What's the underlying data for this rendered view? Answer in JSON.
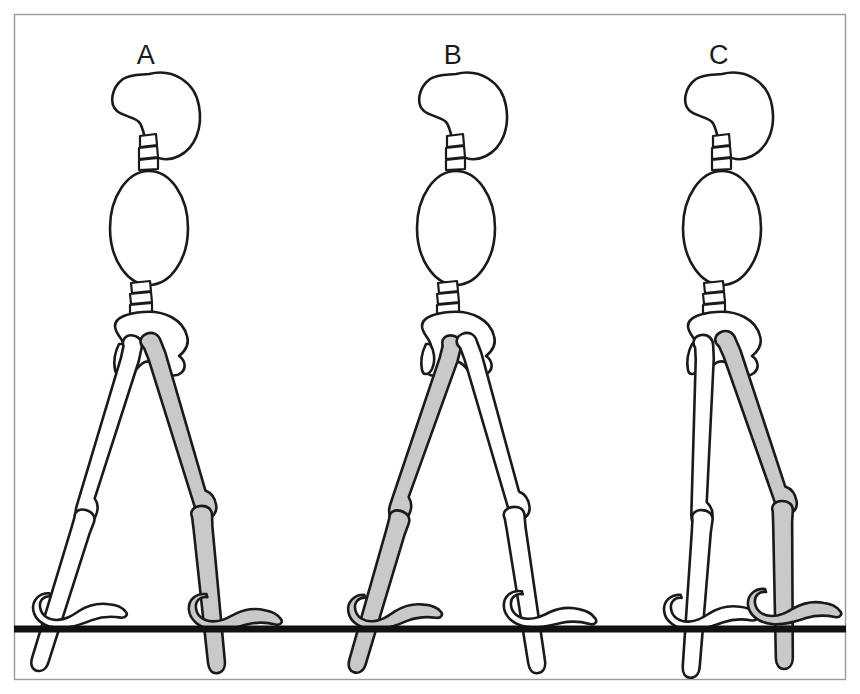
{
  "figure": {
    "panel": {
      "background_color": "#ffffff",
      "border_color": "#9a9a9a",
      "x": 14,
      "y": 14,
      "width": 832,
      "height": 666
    },
    "ground": {
      "label": "ground-line",
      "color": "#111111",
      "y": 629,
      "x_start": 14,
      "x_end": 846,
      "thickness": 7
    },
    "colors": {
      "outline": "#1a1a1a",
      "bone_fill_white": "#ffffff",
      "bone_fill_highlight": "#c9c9c9",
      "label_text": "#1b1b1b",
      "panel_border": "#9a9a9a"
    },
    "legend": {
      "highlight_meaning": "shaded limb",
      "plain_meaning": "contralateral limb"
    },
    "panels": [
      {
        "id": "A",
        "label": "A",
        "label_x": 146,
        "label_y": 64,
        "phase": "initial contact / double support",
        "highlighted_side": "right",
        "highlighted_leg_direction": "forward-down-right, heel strike",
        "plain_leg_direction": "back-down-left, toe off"
      },
      {
        "id": "B",
        "label": "B",
        "label_x": 453,
        "label_y": 64,
        "phase": "double support, limbs reversed",
        "highlighted_side": "right",
        "highlighted_leg_direction": "back-down-left, trailing",
        "plain_leg_direction": "forward-down-right, leading"
      },
      {
        "id": "C",
        "label": "C",
        "label_x": 719,
        "label_y": 64,
        "phase": "midstance, limbs adjacent",
        "highlighted_side": "right",
        "highlighted_leg_direction": "forward-down-right, swinging through",
        "plain_leg_direction": "near vertical, supporting"
      }
    ],
    "body_parts": [
      "skull",
      "cervical-vertebrae",
      "thorax",
      "lumbar-vertebrae",
      "pelvis",
      "femur",
      "patella",
      "tibia-fibula",
      "foot"
    ],
    "segment_counts": {
      "cervical_vertebrae": 3,
      "lumbar_vertebrae": 3,
      "figures": 3,
      "legs_per_figure": 2
    }
  }
}
